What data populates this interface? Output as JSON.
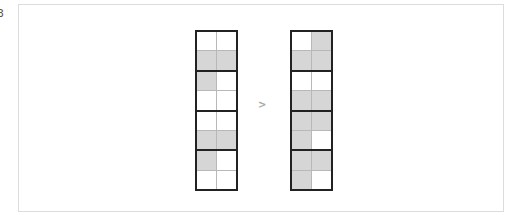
{
  "edge_label": "3",
  "arrow_glyph": ">",
  "colors": {
    "filled": "#d6d6d6",
    "empty": "#ffffff",
    "grid_border": "#222222",
    "inner_line": "#b8b8b8",
    "frame_border": "#dcdcdc"
  },
  "grids": {
    "left": {
      "rows": [
        [
          false,
          false
        ],
        [
          true,
          true
        ],
        [
          true,
          false
        ],
        [
          false,
          false
        ],
        [
          false,
          false
        ],
        [
          true,
          true
        ],
        [
          true,
          false
        ],
        [
          false,
          false
        ]
      ]
    },
    "right": {
      "rows": [
        [
          false,
          true
        ],
        [
          true,
          true
        ],
        [
          false,
          false
        ],
        [
          true,
          true
        ],
        [
          true,
          true
        ],
        [
          true,
          false
        ],
        [
          true,
          true
        ],
        [
          true,
          false
        ]
      ]
    }
  }
}
